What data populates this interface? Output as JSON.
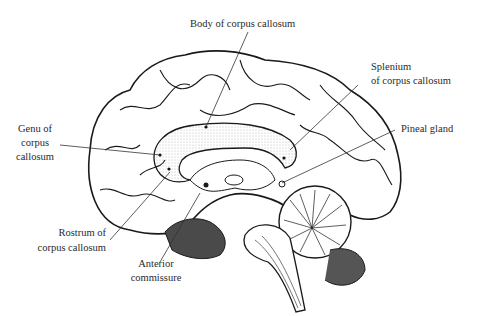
{
  "figure": {
    "labels": {
      "body": "Body of corpus callosum",
      "splenium_1": "Splenium",
      "splenium_2": "of corpus callosum",
      "pineal": "Pineal gland",
      "genu_1": "Genu of",
      "genu_2": "corpus",
      "genu_3": "callosum",
      "rostrum_1": "Rostrum of",
      "rostrum_2": "corpus callosum",
      "anterior_1": "Anterior",
      "anterior_2": "commissure"
    },
    "colors": {
      "ink": "#1a1a1a",
      "background": "#ffffff",
      "stipple": "#bdbdbd"
    }
  }
}
